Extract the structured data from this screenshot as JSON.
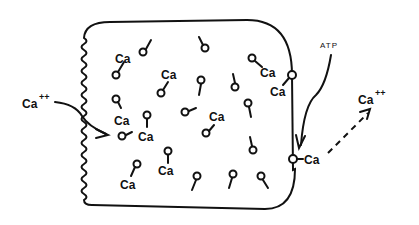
{
  "diagram": {
    "type": "cell calcium transport schematic",
    "labels": {
      "ca_in": "Ca",
      "ca_in_charge": "++",
      "ca_out": "Ca",
      "ca_out_charge": "++",
      "atp": "ATP",
      "carrier_ca": "Ca",
      "bound_ca": "Ca"
    },
    "internal_ca_labels": [
      "Ca",
      "Ca",
      "Ca",
      "Ca",
      "Ca",
      "Ca",
      "Ca",
      "Ca"
    ],
    "colors": {
      "ink": "#111111",
      "background": "#ffffff"
    }
  }
}
